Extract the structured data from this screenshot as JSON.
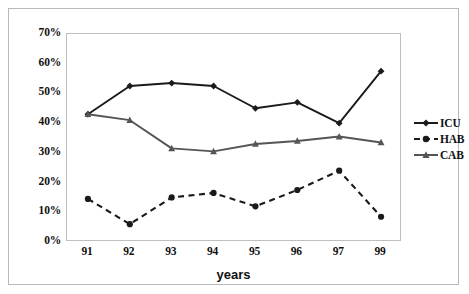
{
  "chart_data": {
    "type": "line",
    "title": "",
    "subtitle": "",
    "xlabel": "years",
    "ylabel": "",
    "categories": [
      "91",
      "92",
      "93",
      "94",
      "95",
      "96",
      "97",
      "99"
    ],
    "ylim": [
      0,
      70
    ],
    "ytick_labels": [
      "0%",
      "10%",
      "20%",
      "30%",
      "40%",
      "50%",
      "60%",
      "70%"
    ],
    "ytick_values": [
      0,
      10,
      20,
      30,
      40,
      50,
      60,
      70
    ],
    "grid": false,
    "legend_position": "right",
    "series": [
      {
        "name": "ICU",
        "marker": "diamond",
        "linestyle": "solid",
        "color": "#1a1a1a",
        "values": [
          43,
          52.5,
          53.5,
          52.5,
          45,
          47,
          40,
          57.5
        ]
      },
      {
        "name": "HAB",
        "marker": "circle",
        "linestyle": "dashed",
        "color": "#1a1a1a",
        "values": [
          14.5,
          6,
          15,
          16.5,
          12,
          17.5,
          24,
          8.5
        ]
      },
      {
        "name": "CAB",
        "marker": "triangle",
        "linestyle": "solid",
        "color": "#555555",
        "values": [
          43,
          41,
          31.5,
          30.5,
          33,
          34,
          35.5,
          33.5
        ]
      }
    ]
  },
  "legend": {
    "items": [
      {
        "label": "ICU"
      },
      {
        "label": "HAB"
      },
      {
        "label": "CAB"
      }
    ]
  },
  "axis": {
    "x_title": "years"
  }
}
